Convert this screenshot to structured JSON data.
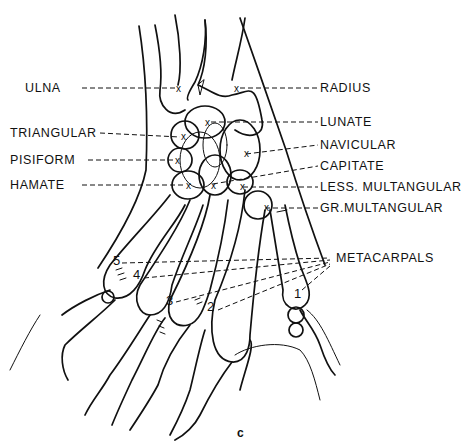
{
  "diagram": {
    "caption": "c",
    "labels_left": [
      {
        "text": "ULNA",
        "x": 25,
        "y": 83
      },
      {
        "text": "TRIANGULAR",
        "x": 10,
        "y": 129
      },
      {
        "text": "PISIFORM",
        "x": 10,
        "y": 155
      },
      {
        "text": "HAMATE",
        "x": 10,
        "y": 180
      }
    ],
    "labels_right": [
      {
        "text": "RADIUS",
        "x": 320,
        "y": 83
      },
      {
        "text": "LUNATE",
        "x": 320,
        "y": 118
      },
      {
        "text": "NAVICULAR",
        "x": 320,
        "y": 140
      },
      {
        "text": "CAPITATE",
        "x": 320,
        "y": 161
      },
      {
        "text": "LESS. MULTANGULAR",
        "x": 320,
        "y": 182
      },
      {
        "text": "GR.MULTANGULAR",
        "x": 320,
        "y": 203
      }
    ],
    "metacarpals_label": {
      "text": "METACARPALS",
      "x": 336,
      "y": 253
    },
    "metacarpal_numbers": [
      {
        "text": "5",
        "x": 113,
        "y": 261
      },
      {
        "text": "4",
        "x": 133,
        "y": 274
      },
      {
        "text": "3",
        "x": 166,
        "y": 300
      },
      {
        "text": "2",
        "x": 207,
        "y": 306
      },
      {
        "text": "1",
        "x": 294,
        "y": 293
      }
    ],
    "marker_symbol": "x",
    "colors": {
      "ink": "#111111",
      "paper": "#ffffff"
    }
  }
}
